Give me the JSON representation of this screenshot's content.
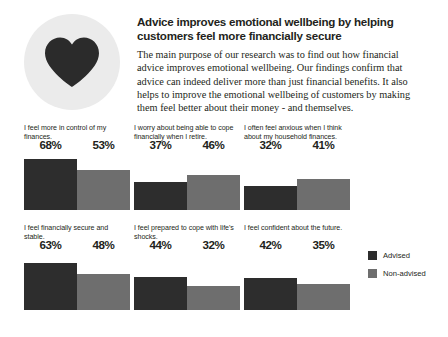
{
  "header": {
    "icon": "heart-icon",
    "headline": "Advice improves emotional wellbeing by helping customers feel more financially secure",
    "body": "The main purpose of our research was to find out how financial advice improves emotional wellbeing. Our findings confirm that advice can indeed deliver more than just financial benefits. It also helps to improve the emotional wellbeing of customers by making them feel better about their money - and themselves."
  },
  "legend": {
    "items": [
      {
        "label": "Advised",
        "color": "#2d2d2d"
      },
      {
        "label": "Non-advised",
        "color": "#6e6e6e"
      }
    ]
  },
  "chart_data": {
    "type": "bar",
    "title": "Advice improves emotional wellbeing by helping customers feel more financially secure",
    "xlabel": "",
    "ylabel": "",
    "ylim": [
      0,
      100
    ],
    "grid": false,
    "legend_position": "right",
    "series": [
      {
        "name": "Advised",
        "color": "#2d2d2d",
        "values": [
          68,
          37,
          32,
          63,
          44,
          42
        ]
      },
      {
        "name": "Non-advised",
        "color": "#6e6e6e",
        "values": [
          53,
          46,
          41,
          48,
          32,
          35
        ]
      }
    ],
    "categories": [
      "I feel more in control of my finances.",
      "I worry about being able to cope financially when I retire.",
      "I often feel anxious when I think about my household finances.",
      "I feel financially secure and stable.",
      "I feel prepared to cope with life's shocks.",
      "I feel confident about the future."
    ],
    "panels": [
      {
        "caption": "I feel more in control of my finances.",
        "advised": 68,
        "advised_label": "68%",
        "nonadvised": 53,
        "nonadvised_label": "53%"
      },
      {
        "caption": "I worry about being able to cope financially when I retire.",
        "advised": 37,
        "advised_label": "37%",
        "nonadvised": 46,
        "nonadvised_label": "46%"
      },
      {
        "caption": "I often feel anxious when I think about my household finances.",
        "advised": 32,
        "advised_label": "32%",
        "nonadvised": 41,
        "nonadvised_label": "41%"
      },
      {
        "caption": "I feel financially secure and stable.",
        "advised": 63,
        "advised_label": "63%",
        "nonadvised": 48,
        "nonadvised_label": "48%"
      },
      {
        "caption": "I feel prepared to cope with life's shocks.",
        "advised": 44,
        "advised_label": "44%",
        "nonadvised": 32,
        "nonadvised_label": "32%"
      },
      {
        "caption": "I feel confident about the future.",
        "advised": 42,
        "advised_label": "42%",
        "nonadvised": 35,
        "nonadvised_label": "35%"
      }
    ]
  }
}
